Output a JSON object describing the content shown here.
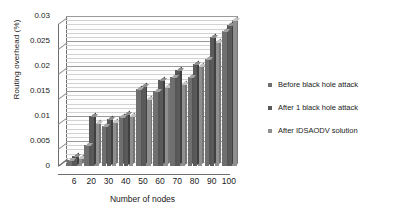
{
  "chart_data": {
    "type": "bar",
    "title": "",
    "xlabel": "Number of nodes",
    "ylabel": "Routing overhead (%)",
    "categories": [
      "6",
      "20",
      "30",
      "40",
      "50",
      "60",
      "70",
      "80",
      "90",
      "100"
    ],
    "ytick_labels": [
      "0",
      "0.005",
      "0.01",
      "0.015",
      "0.02",
      "0.025",
      "0.03"
    ],
    "ytick_values": [
      0,
      0.005,
      0.01,
      0.015,
      0.02,
      0.025,
      0.03
    ],
    "ylim": [
      0,
      0.03
    ],
    "grid": true,
    "legend_position": "right",
    "style": "3d-column",
    "series": [
      {
        "name": "Before black hole attack",
        "color": "#6f6f6f",
        "values": [
          0.0013,
          0.0043,
          0.008,
          0.0098,
          0.0155,
          0.015,
          0.0178,
          0.0178,
          0.0215,
          0.027
        ]
      },
      {
        "name": "After 1 black hole attack",
        "color": "#5a5a5a",
        "values": [
          0.0021,
          0.0101,
          0.0095,
          0.0105,
          0.016,
          0.0172,
          0.0192,
          0.0205,
          0.0258,
          0.0283
        ]
      },
      {
        "name": "After IDSAODV solution",
        "color": "#8f8f8f",
        "values": [
          0.0016,
          0.0086,
          0.0088,
          0.01,
          0.0135,
          0.0158,
          0.0165,
          0.02,
          0.0248,
          0.0293
        ]
      }
    ]
  },
  "legend": {
    "items": [
      {
        "label": "Before black hole attack",
        "color": "#6f6f6f"
      },
      {
        "label": "After 1 black hole attack",
        "color": "#5a5a5a"
      },
      {
        "label": "After IDSAODV solution",
        "color": "#8f8f8f"
      }
    ]
  }
}
